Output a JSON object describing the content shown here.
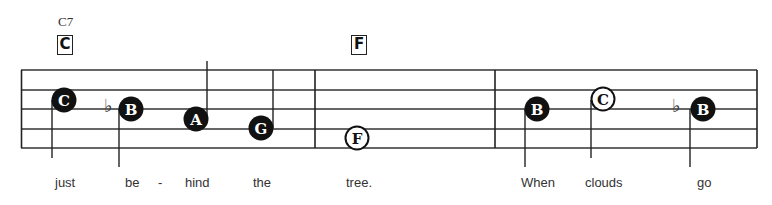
{
  "chords": [
    {
      "small": "C7",
      "box": "C"
    },
    {
      "box": "F"
    }
  ],
  "notes": [
    {
      "letter": "C",
      "style": "filled"
    },
    {
      "letter": "B",
      "style": "filled",
      "accidental": "flat"
    },
    {
      "letter": "A",
      "style": "filled"
    },
    {
      "letter": "G",
      "style": "filled"
    },
    {
      "letter": "F",
      "style": "open"
    },
    {
      "letter": "B",
      "style": "filled"
    },
    {
      "letter": "C",
      "style": "open"
    },
    {
      "letter": "B",
      "style": "filled",
      "accidental": "flat"
    }
  ],
  "lyrics": [
    "just",
    "be",
    "-",
    "hind",
    "the",
    "tree.",
    "When",
    "clouds",
    "go"
  ],
  "flat_symbol": "♭"
}
